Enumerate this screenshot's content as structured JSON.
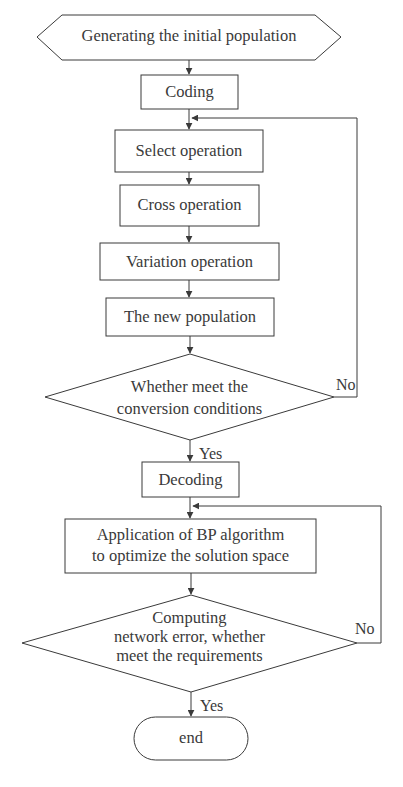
{
  "diagram": {
    "type": "flowchart",
    "nodes": [
      {
        "id": "start",
        "shape": "hexagon",
        "label": "Generating the initial population"
      },
      {
        "id": "coding",
        "shape": "rect",
        "label": "Coding"
      },
      {
        "id": "select",
        "shape": "rect",
        "label": "Select operation"
      },
      {
        "id": "cross",
        "shape": "rect",
        "label": "Cross operation"
      },
      {
        "id": "variation",
        "shape": "rect",
        "label": "Variation operation"
      },
      {
        "id": "newpop",
        "shape": "rect",
        "label": "The new population"
      },
      {
        "id": "decision1",
        "shape": "diamond",
        "lines": [
          "Whether meet the",
          "conversion conditions"
        ]
      },
      {
        "id": "decoding",
        "shape": "rect",
        "label": "Decoding"
      },
      {
        "id": "bp",
        "shape": "rect",
        "lines": [
          "Application of BP algorithm",
          "to optimize the solution space"
        ]
      },
      {
        "id": "decision2",
        "shape": "diamond",
        "lines": [
          "Computing",
          "network error, whether",
          "meet the requirements"
        ]
      },
      {
        "id": "end",
        "shape": "terminator",
        "label": "end"
      }
    ],
    "edges": [
      {
        "from": "start",
        "to": "coding"
      },
      {
        "from": "coding",
        "to": "select"
      },
      {
        "from": "select",
        "to": "cross"
      },
      {
        "from": "cross",
        "to": "variation"
      },
      {
        "from": "variation",
        "to": "newpop"
      },
      {
        "from": "newpop",
        "to": "decision1"
      },
      {
        "from": "decision1",
        "to": "select",
        "label": "No"
      },
      {
        "from": "decision1",
        "to": "decoding",
        "label": "Yes"
      },
      {
        "from": "decoding",
        "to": "bp"
      },
      {
        "from": "bp",
        "to": "decision2"
      },
      {
        "from": "decision2",
        "to": "bp",
        "label": "No"
      },
      {
        "from": "decision2",
        "to": "end",
        "label": "Yes"
      }
    ],
    "branch_labels": {
      "no1": "No",
      "yes1": "Yes",
      "no2": "No",
      "yes2": "Yes"
    },
    "colors": {
      "stroke": "#3a3a3a",
      "background": "#ffffff",
      "text": "#3a3a3a"
    }
  }
}
